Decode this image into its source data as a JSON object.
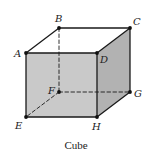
{
  "figure": {
    "caption": "Cube",
    "colors": {
      "front_face": "#c9c9c9",
      "side_face": "#b2b2b2",
      "top_face": "#ffffff",
      "edge": "#1a1a1a",
      "vertex": "#111111"
    },
    "vertices": {
      "A": {
        "label": "A"
      },
      "B": {
        "label": "B"
      },
      "C": {
        "label": "C"
      },
      "D": {
        "label": "D"
      },
      "E": {
        "label": "E"
      },
      "F": {
        "label": "F"
      },
      "G": {
        "label": "G"
      },
      "H": {
        "label": "H"
      }
    },
    "visible_edges": [
      [
        "A",
        "B"
      ],
      [
        "B",
        "C"
      ],
      [
        "C",
        "D"
      ],
      [
        "D",
        "A"
      ],
      [
        "A",
        "E"
      ],
      [
        "E",
        "H"
      ],
      [
        "H",
        "D"
      ],
      [
        "C",
        "G"
      ],
      [
        "G",
        "H"
      ]
    ],
    "hidden_edges": [
      [
        "B",
        "F"
      ],
      [
        "F",
        "G"
      ],
      [
        "F",
        "E"
      ]
    ],
    "faces": {
      "front": [
        "A",
        "D",
        "H",
        "E"
      ],
      "side": [
        "D",
        "C",
        "G",
        "H"
      ],
      "top": [
        "A",
        "B",
        "C",
        "D"
      ]
    }
  }
}
